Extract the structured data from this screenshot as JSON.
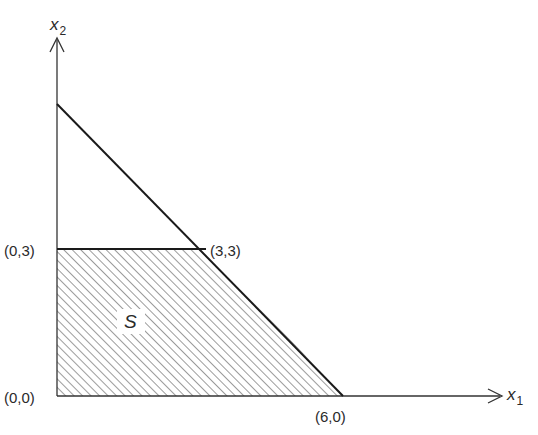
{
  "diagram": {
    "axes": {
      "x_label": "x",
      "x_subscript": "1",
      "y_label": "x",
      "y_subscript": "2"
    },
    "region_label": "S",
    "points": [
      {
        "label": "(0,0)",
        "x": 0,
        "y": 0
      },
      {
        "label": "(0,3)",
        "x": 0,
        "y": 3
      },
      {
        "label": "(3,3)",
        "x": 3,
        "y": 3
      },
      {
        "label": "(6,0)",
        "x": 6,
        "y": 0
      }
    ],
    "constraint_line": {
      "from": [
        0,
        6
      ],
      "to": [
        6,
        0
      ]
    },
    "colors": {
      "line": "#1a1a1a",
      "hatch": "#555555",
      "background": "#ffffff"
    }
  }
}
